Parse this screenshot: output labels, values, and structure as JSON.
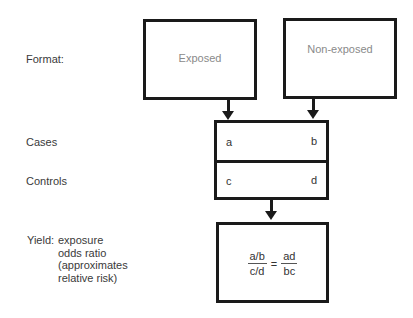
{
  "labels": {
    "format": "Format:",
    "cases": "Cases",
    "controls": "Controls",
    "yield_prefix": "Yield:",
    "yield_lines": [
      "exposure",
      "odds ratio",
      "(approximates",
      "relative risk)"
    ]
  },
  "boxes": {
    "exposed": "Exposed",
    "non_exposed": "Non-exposed"
  },
  "table": {
    "cells": {
      "a": "a",
      "b": "b",
      "c": "c",
      "d": "d"
    }
  },
  "formula": {
    "left_num": "a/b",
    "left_den": "c/d",
    "equals": "=",
    "right_num": "ad",
    "right_den": "bc"
  },
  "colors": {
    "stroke": "#1a1a1a",
    "box_title": "#8a8a8a",
    "text": "#3a3a3a"
  }
}
